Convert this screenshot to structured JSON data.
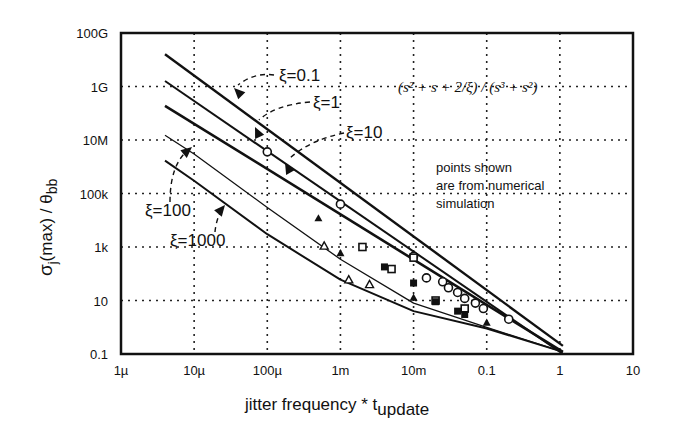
{
  "chart_data": {
    "type": "line",
    "title": "",
    "xlabel": "jitter frequency * t_update",
    "xlabel_main": "jitter frequency * t",
    "xlabel_sub": "update",
    "ylabel": "σj(max) / θbb",
    "ylabel_sigma": "σ",
    "ylabel_j": "j",
    "ylabel_max": "(max) / θ",
    "ylabel_bb": "bb",
    "x_scale": "log",
    "y_scale": "log",
    "xlim": [
      1e-06,
      10
    ],
    "ylim": [
      0.1,
      100000000000.0
    ],
    "x_ticks": [
      "1µ",
      "10µ",
      "100µ",
      "1m",
      "10m",
      "0.1",
      "1",
      "10"
    ],
    "y_ticks": [
      "100G",
      "1G",
      "10M",
      "100k",
      "1k",
      "10",
      "0.1"
    ],
    "grid": "dotted",
    "formula": "(s² + s + 2/ξ) / (s³ + s²)",
    "note": [
      "points shown",
      "are from numerical",
      "simulation"
    ],
    "series": [
      {
        "name": "ξ=0.1",
        "x": [
          4e-06,
          1.1
        ],
        "y": [
          16000000000.0,
          0.2
        ]
      },
      {
        "name": "ξ=1",
        "x": [
          4e-06,
          1.1
        ],
        "y": [
          1600000000.0,
          0.1
        ]
      },
      {
        "name": "ξ=10",
        "x": [
          4e-06,
          1.1
        ],
        "y": [
          190000000.0,
          0.12
        ]
      },
      {
        "name": "ξ=100",
        "x": [
          4e-06,
          1e-05,
          0.0001,
          0.001,
          0.01,
          0.1,
          1.1
        ],
        "y": [
          15000000.0,
          3000000.0,
          30000.0,
          350,
          8,
          1,
          0.12
        ]
      },
      {
        "name": "ξ=1000",
        "x": [
          4e-06,
          1e-05,
          0.0001,
          0.001,
          0.01,
          0.1,
          1.1
        ],
        "y": [
          1700000.0,
          300000.0,
          3000.0,
          60,
          4,
          0.9,
          0.12
        ]
      }
    ],
    "simulation_points": {
      "circles": [
        [
          0.0001,
          3600000.0
        ],
        [
          0.001,
          40000.0
        ],
        [
          0.01,
          450
        ],
        [
          0.015,
          70
        ],
        [
          0.025,
          50
        ],
        [
          0.03,
          30
        ],
        [
          0.04,
          20
        ],
        [
          0.05,
          12
        ],
        [
          0.07,
          8
        ],
        [
          0.09,
          5
        ],
        [
          0.2,
          2
        ]
      ],
      "open_squares": [
        [
          0.002,
          1000.0
        ],
        [
          0.005,
          150
        ],
        [
          0.01,
          400
        ],
        [
          0.02,
          10
        ],
        [
          0.05,
          5
        ]
      ],
      "filled_squares": [
        [
          0.004,
          180
        ],
        [
          0.01,
          45
        ],
        [
          0.02,
          9
        ],
        [
          0.04,
          4
        ],
        [
          0.05,
          3
        ]
      ],
      "open_triangles": [
        [
          0.0006,
          1100.0
        ],
        [
          0.0013,
          60
        ],
        [
          0.0025,
          40
        ]
      ],
      "filled_triangles": [
        [
          0.0005,
          12000.0
        ],
        [
          0.001,
          600
        ],
        [
          0.01,
          13
        ],
        [
          0.1,
          1.5
        ]
      ]
    },
    "annotations": [
      {
        "text": "ξ=0.1"
      },
      {
        "text": "ξ=1"
      },
      {
        "text": "ξ=10"
      },
      {
        "text": "ξ=100"
      },
      {
        "text": "ξ=1000"
      }
    ]
  }
}
